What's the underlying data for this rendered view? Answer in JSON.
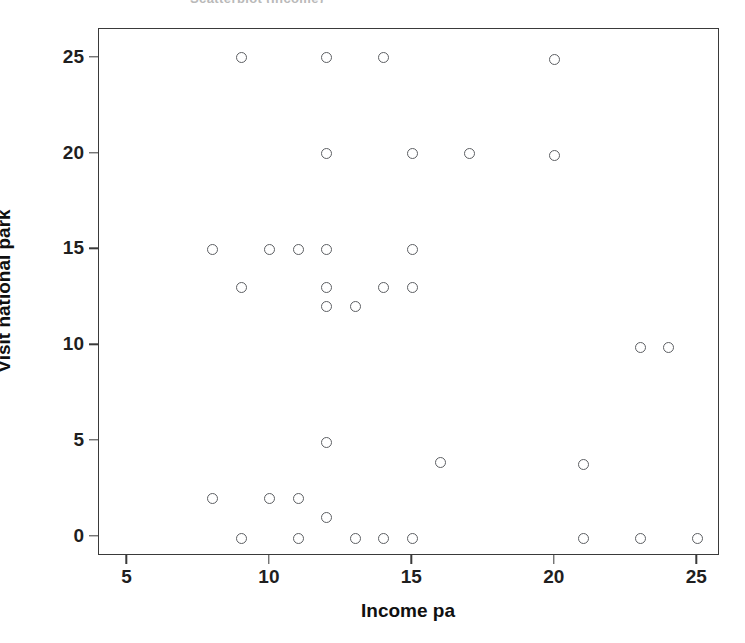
{
  "figure": {
    "clipped_title": "Scatterplot (Income)",
    "background_color": "#ffffff",
    "frame_color": "#3a3a3a",
    "marker_color": "#5d5f63"
  },
  "chart_data": {
    "type": "scatter",
    "title": "",
    "xlabel": "Income pa",
    "ylabel": "Visit national park",
    "xlim": [
      4.0,
      25.8
    ],
    "ylim": [
      -1.0,
      26.5
    ],
    "xticks": [
      5,
      10,
      15,
      20,
      25
    ],
    "yticks": [
      0,
      5,
      10,
      15,
      20,
      25
    ],
    "grid": false,
    "legend": "none",
    "marker": "open-circle",
    "x": [
      9,
      12,
      14,
      20,
      12,
      15,
      17,
      20,
      8,
      10,
      11,
      12,
      15,
      9,
      12,
      14,
      15,
      12,
      13,
      23,
      24,
      12,
      16,
      21,
      8,
      10,
      11,
      12,
      9,
      11,
      13,
      14,
      15,
      21,
      23,
      25
    ],
    "y": [
      25,
      25,
      25,
      24.9,
      20,
      20,
      20,
      19.9,
      15,
      15,
      15,
      15,
      15,
      13,
      13,
      13,
      13,
      12,
      12,
      9.9,
      9.9,
      4.9,
      3.9,
      3.8,
      2,
      2,
      2,
      1,
      -0.1,
      -0.1,
      -0.1,
      -0.1,
      -0.1,
      -0.1,
      -0.1,
      -0.1
    ],
    "n_points": 36
  }
}
